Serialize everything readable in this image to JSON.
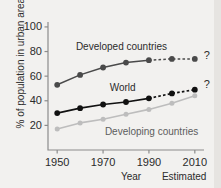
{
  "chart_data": {
    "type": "line",
    "title": "",
    "xlabel": "Year",
    "ylabel": "% of population in urban areas",
    "x": [
      1950,
      1960,
      1970,
      1980,
      1990,
      2000,
      2010
    ],
    "xtick_labels": [
      "1950",
      "1970",
      "1990",
      "2010"
    ],
    "xticks": [
      1950,
      1970,
      1990,
      2010
    ],
    "xlim": [
      1946,
      2014
    ],
    "ytick_labels": [
      "20",
      "40",
      "60",
      "80",
      "100"
    ],
    "yticks": [
      20,
      40,
      60,
      80,
      100
    ],
    "ylim": [
      0,
      104
    ],
    "grid": false,
    "legend": "inline-labels",
    "estimated_label": "Estimated",
    "estimated_from": 1990,
    "series": [
      {
        "name": "Developed countries",
        "color": "#4a4a4a",
        "values": [
          53,
          61,
          67,
          71,
          73,
          74,
          74
        ],
        "label_x": 1966,
        "label_y": 84,
        "annotation": "?"
      },
      {
        "name": "World",
        "color": "#111111",
        "values": [
          30,
          34,
          37,
          39,
          42,
          46,
          49
        ],
        "label_x": 1972,
        "label_y": 50,
        "annotation": "?"
      },
      {
        "name": "Developing countries",
        "color": "#bdbdbd",
        "values": [
          17,
          22,
          25,
          29,
          33,
          38,
          44
        ],
        "label_x": 1983,
        "label_y": 15,
        "annotation": ""
      }
    ],
    "annotations": [
      {
        "text": "?",
        "x": 2013,
        "y": 76
      },
      {
        "text": "?",
        "x": 2013,
        "y": 53
      }
    ],
    "axis_color": "#8c8c8c",
    "background": "#f2f1ef"
  },
  "axis": {
    "y_title": "% of population in urban areas",
    "x_title": "Year",
    "estimated": "Estimated",
    "y_ticks": [
      "100",
      "80",
      "60",
      "40",
      "20"
    ],
    "x_ticks": [
      "1950",
      "1970",
      "1990",
      "2010"
    ]
  },
  "labels": {
    "developed": "Developed countries",
    "world": "World",
    "developing": "Developing countries",
    "question_top": "?",
    "question_bottom": "?"
  }
}
